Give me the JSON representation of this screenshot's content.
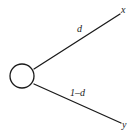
{
  "figure": {
    "type": "binary-split-node-diagram",
    "background_color": "#ffffff",
    "stroke_color": "#1a1a1a"
  },
  "node": {
    "name": "split-node",
    "shape": "circle",
    "center_x": 22,
    "center_y": 76,
    "radius": 12,
    "fill": "#ffffff",
    "stroke": "#1a1a1a"
  },
  "branches": [
    {
      "id": "upper",
      "label": "d",
      "from_x": 34,
      "from_y": 69,
      "to_x": 120,
      "to_y": 14,
      "endpoint_label": "x"
    },
    {
      "id": "lower",
      "label": "1–d",
      "from_x": 34,
      "from_y": 84,
      "to_x": 121,
      "to_y": 123,
      "endpoint_label": "y"
    }
  ],
  "labels": {
    "upper_branch_weight": "d",
    "lower_branch_weight": "1–d",
    "upper_endpoint": "x",
    "lower_endpoint": "y"
  }
}
